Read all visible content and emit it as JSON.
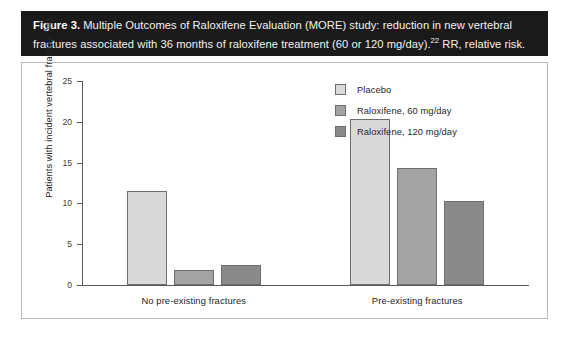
{
  "figure": {
    "label": "Figure 3.",
    "caption_part1": " Multiple Outcomes of Raloxifene Evaluation (MORE) study: reduction in new vertebral fractures associated with 36 months of raloxifene treatment (60 or 120 mg/day).",
    "caption_superscript": "22",
    "caption_part2": " RR, relative risk."
  },
  "chart_data": {
    "type": "bar",
    "title": "",
    "xlabel": "",
    "ylabel": "Patients with incident vertebral fracture (%)",
    "categories": [
      "No pre-existing fractures",
      "Pre-existing fractures"
    ],
    "ylim": [
      0,
      25
    ],
    "yticks": [
      0,
      5,
      10,
      15,
      20,
      25
    ],
    "ytick_labels": [
      "0",
      "5",
      "10",
      "15",
      "20",
      "25"
    ],
    "grid": false,
    "legend_position": "top-right",
    "series": [
      {
        "name": "Placebo",
        "color": "#d9d9d9",
        "values": [
          11.5,
          20.3
        ]
      },
      {
        "name": "Raloxifene, 60 mg/day",
        "color": "#a3a3a3",
        "values": [
          1.9,
          14.3
        ]
      },
      {
        "name": "Raloxifene, 120 mg/day",
        "color": "#8a8a8a",
        "values": [
          2.4,
          10.3
        ]
      }
    ]
  },
  "colors": {
    "caption_bar": "#1a1a1a",
    "panel_border": "#b9b9b9",
    "axis": "#5a5a5a",
    "bar_outline": "#6e6e6e"
  }
}
